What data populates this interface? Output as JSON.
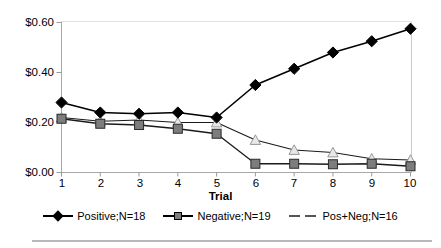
{
  "chart_data": {
    "type": "line",
    "title": "",
    "xlabel": "Trial",
    "ylabel": "",
    "categories": [
      "1",
      "2",
      "3",
      "4",
      "5",
      "6",
      "7",
      "8",
      "9",
      "10"
    ],
    "x": [
      1,
      2,
      3,
      4,
      5,
      6,
      7,
      8,
      9,
      10
    ],
    "ylim": [
      0.0,
      0.6
    ],
    "ytick_values": [
      0.0,
      0.2,
      0.4,
      0.6
    ],
    "ytick_labels": [
      "$0.00",
      "$0.20",
      "$0.40",
      "$0.60"
    ],
    "grid": false,
    "legend_position": "bottom",
    "series": [
      {
        "name": "Positive;N=18",
        "marker": "diamond",
        "color": "#000000",
        "linestyle": "solid",
        "values": [
          0.28,
          0.24,
          0.235,
          0.24,
          0.22,
          0.35,
          0.415,
          0.48,
          0.525,
          0.575
        ]
      },
      {
        "name": "Negative;N=19",
        "marker": "square",
        "color": "#7f7f7f",
        "linestyle": "solid",
        "values": [
          0.215,
          0.195,
          0.19,
          0.175,
          0.155,
          0.035,
          0.035,
          0.033,
          0.035,
          0.025
        ]
      },
      {
        "name": "Pos+Neg;N=16",
        "marker": "triangle",
        "color": "#d9d9d9",
        "linestyle": "dashed",
        "values": [
          0.22,
          0.205,
          0.21,
          0.2,
          0.2,
          0.13,
          0.09,
          0.08,
          0.055,
          0.05
        ]
      }
    ]
  },
  "axis": {
    "x_title": "Trial",
    "x_tick_labels": [
      "1",
      "2",
      "3",
      "4",
      "5",
      "6",
      "7",
      "8",
      "9",
      "10"
    ],
    "y_tick_labels": [
      "$0.00",
      "$0.20",
      "$0.40",
      "$0.60"
    ]
  },
  "legend": {
    "items": [
      {
        "label": "Positive;N=18"
      },
      {
        "label": "Negative;N=19"
      },
      {
        "label": "Pos+Neg;N=16"
      }
    ]
  }
}
